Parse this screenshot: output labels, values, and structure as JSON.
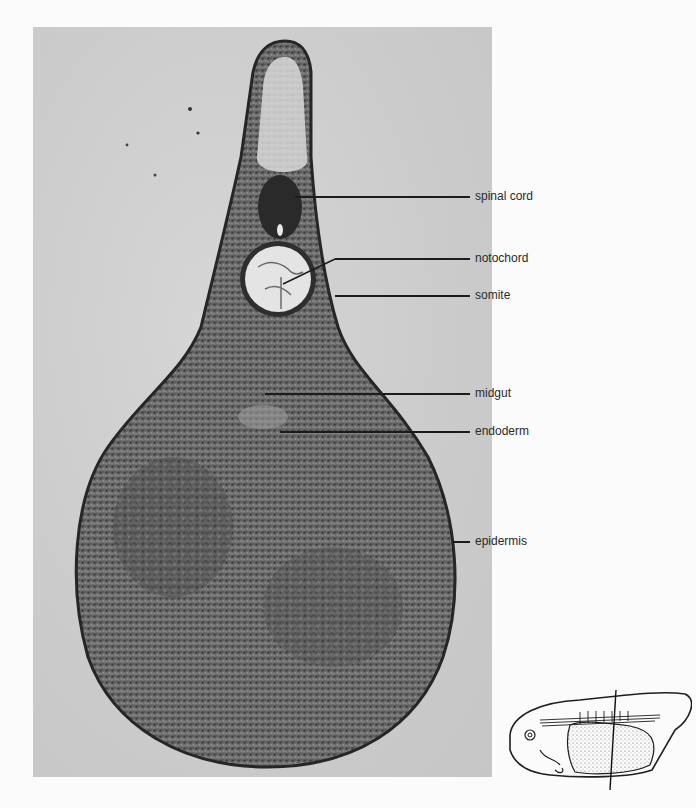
{
  "figure": {
    "type": "micrograph-cross-section",
    "labels": [
      {
        "id": "spinal-cord",
        "text": "spinal cord",
        "x": 475,
        "y": 190,
        "line_y": 197,
        "target_x": 295
      },
      {
        "id": "notochord",
        "text": "notochord",
        "x": 475,
        "y": 252,
        "line_y": 259,
        "target_x": 283
      },
      {
        "id": "somite",
        "text": "somite",
        "x": 475,
        "y": 289,
        "line_y": 296,
        "target_x": 335
      },
      {
        "id": "midgut",
        "text": "midgut",
        "x": 475,
        "y": 387,
        "line_y": 394,
        "target_x": 265
      },
      {
        "id": "endoderm",
        "text": "endoderm",
        "x": 475,
        "y": 425,
        "line_y": 432,
        "target_x": 280
      },
      {
        "id": "epidermis",
        "text": "epidermis",
        "x": 475,
        "y": 535,
        "line_y": 542,
        "target_x": 453
      }
    ],
    "inset": {
      "description": "lateral view of embryo with vertical line marking plane of section"
    }
  }
}
